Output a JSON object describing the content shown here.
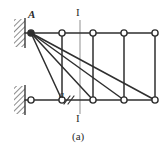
{
  "figure": {
    "caption": "(a)",
    "type": "structural-truss-diagram",
    "colors": {
      "member_stroke": "#2f2f2f",
      "node_fill": "#ffffff",
      "node_stroke": "#2f2f2f",
      "hatch_stroke": "#6e6e6e",
      "section_line": "#8e8e8e",
      "background": "#ffffff",
      "text": "#2b2b2b"
    },
    "labels": {
      "node_A": "A",
      "panel_dimension": "a",
      "section_top": "I",
      "section_bottom": "I"
    },
    "geometry": {
      "top_chord_y": 33,
      "bottom_chord_y": 100,
      "node_radius": 3.1,
      "top_nodes_x": [
        31,
        62,
        93,
        124,
        155
      ],
      "bottom_nodes_x": [
        31,
        62,
        93,
        124,
        155
      ],
      "diagonals_from_A_to_bottom_index": [
        1,
        2,
        3,
        4
      ],
      "verticals_at_index": [
        1,
        2,
        3,
        4
      ],
      "section_line_x": 80,
      "section_line_y_top": 20,
      "section_line_y_bottom": 114
    },
    "supports": [
      {
        "name": "upper-wall-support",
        "x": 14,
        "y": 19,
        "width": 12,
        "height": 28,
        "kind": "fixed-wall-hatch"
      },
      {
        "name": "lower-wall-support",
        "x": 14,
        "y": 86,
        "width": 12,
        "height": 28,
        "kind": "fixed-wall-hatch"
      }
    ]
  }
}
